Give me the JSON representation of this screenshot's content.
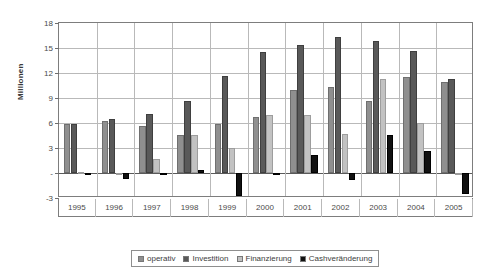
{
  "chart_data": {
    "type": "bar",
    "title": "",
    "subtitle": "",
    "xlabel": "",
    "ylabel": "Millionen",
    "ylim": [
      -3,
      18
    ],
    "yticks": [
      18,
      15,
      12,
      9,
      6,
      3,
      0,
      -3
    ],
    "ytick_labels": [
      "18",
      "15",
      "12",
      "9",
      "6",
      "3",
      "-",
      "-3"
    ],
    "grid": true,
    "legend_position": "bottom",
    "categories": [
      "1995",
      "1996",
      "1997",
      "1998",
      "1999",
      "2000",
      "2001",
      "2002",
      "2003",
      "2004",
      "2005"
    ],
    "series": [
      {
        "name": "operativ",
        "color": "#8f8f8f",
        "values": [
          5.9,
          6.2,
          5.7,
          4.6,
          5.9,
          6.7,
          10.0,
          10.3,
          8.6,
          11.5,
          10.9
        ]
      },
      {
        "name": "Investition",
        "color": "#595959",
        "values": [
          5.9,
          6.5,
          7.1,
          8.6,
          11.7,
          14.5,
          15.4,
          16.3,
          15.9,
          14.7,
          11.3
        ]
      },
      {
        "name": "Finanzierung",
        "color": "#c2c2c2",
        "values": [
          0.1,
          0.05,
          1.7,
          4.6,
          3.0,
          7.0,
          7.0,
          4.7,
          11.3,
          6.0,
          0.05
        ]
      },
      {
        "name": "Cashveränderung",
        "color": "#111111",
        "values": [
          -0.15,
          -0.7,
          0.05,
          0.4,
          -2.8,
          -0.25,
          2.2,
          -0.8,
          4.6,
          2.7,
          -2.5
        ]
      }
    ]
  },
  "legend": {
    "items": [
      {
        "label": "operativ",
        "color": "#8f8f8f"
      },
      {
        "label": "Investition",
        "color": "#595959"
      },
      {
        "label": "Finanzierung",
        "color": "#c2c2c2"
      },
      {
        "label": "Cashveränderung",
        "color": "#111111"
      }
    ]
  }
}
